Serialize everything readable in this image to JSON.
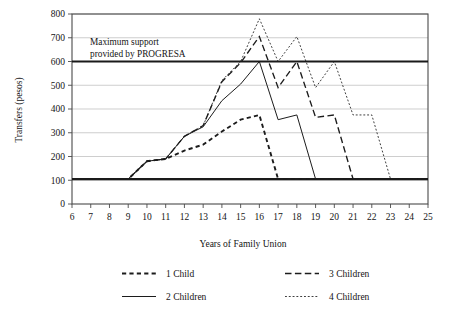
{
  "chart_data": {
    "type": "line",
    "title": "",
    "xlabel": "Years of Family Union",
    "ylabel": "Transfers (pesos)",
    "xlim": [
      6,
      25
    ],
    "ylim": [
      0,
      800
    ],
    "xticks": [
      6,
      7,
      8,
      9,
      10,
      11,
      12,
      13,
      14,
      15,
      16,
      17,
      18,
      19,
      20,
      21,
      22,
      23,
      24,
      25
    ],
    "yticks": [
      0,
      100,
      200,
      300,
      400,
      500,
      600,
      700,
      800
    ],
    "grid": "horizontal",
    "legend_position": "below-axes",
    "annotations": [
      {
        "name": "max-support-note",
        "text_line1": "Maximum support",
        "text_line2": "provided by PROGRESA",
        "value": 600
      }
    ],
    "reference_lines": [
      {
        "name": "maximum-support-line",
        "value": 600,
        "style": "thick-solid"
      },
      {
        "name": "baseline-minimum-line",
        "value": 105,
        "style": "thick-solid"
      }
    ],
    "x": [
      6,
      7,
      8,
      9,
      10,
      11,
      12,
      13,
      14,
      15,
      16,
      17,
      18,
      19,
      20,
      21,
      22,
      23,
      24,
      25
    ],
    "series": [
      {
        "name": "1 Child",
        "style": "short-dashed",
        "values": [
          105,
          105,
          105,
          105,
          180,
          190,
          225,
          250,
          305,
          355,
          375,
          105,
          105,
          105,
          105,
          105,
          105,
          105,
          105,
          105
        ]
      },
      {
        "name": "2 Children",
        "style": "solid",
        "values": [
          105,
          105,
          105,
          105,
          180,
          190,
          285,
          325,
          435,
          505,
          600,
          355,
          375,
          105,
          105,
          105,
          105,
          105,
          105,
          105
        ]
      },
      {
        "name": "3 Children",
        "style": "long-dashed",
        "values": [
          105,
          105,
          105,
          105,
          180,
          190,
          285,
          330,
          515,
          595,
          705,
          490,
          600,
          365,
          375,
          105,
          105,
          105,
          105,
          105
        ]
      },
      {
        "name": "4 Children",
        "style": "dotted",
        "values": [
          105,
          105,
          105,
          105,
          180,
          190,
          285,
          330,
          520,
          600,
          780,
          600,
          705,
          490,
          600,
          375,
          375,
          105,
          105,
          105
        ]
      }
    ]
  },
  "legend": {
    "entries": [
      {
        "label": "1 Child",
        "style": "short-dashed"
      },
      {
        "label": "2 Children",
        "style": "solid"
      },
      {
        "label": "3 Children",
        "style": "long-dashed"
      },
      {
        "label": "4 Children",
        "style": "dotted"
      }
    ]
  }
}
